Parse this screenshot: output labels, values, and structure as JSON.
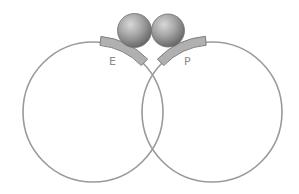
{
  "diagram": {
    "labels": {
      "left_site": "E",
      "right_site": "P"
    },
    "elements": {
      "circles": [
        "left-circle",
        "right-circle"
      ],
      "spheres": [
        "left-sphere",
        "right-sphere"
      ],
      "bars": [
        "E-bar",
        "P-bar"
      ]
    },
    "colors": {
      "circle_stroke": "#9a9a9a",
      "bar_fill": "#b0b0b0",
      "bar_stroke": "#7e7e7e",
      "sphere_light": "#d4d4d4",
      "sphere_dark": "#6a6a6a",
      "label": "#8a8a8a"
    }
  }
}
